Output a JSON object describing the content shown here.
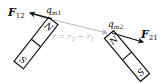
{
  "diagram": {
    "magnets": [
      {
        "id": "magnet-1",
        "north_label": "N",
        "south_label": "S",
        "pole_charge_label": "q",
        "pole_charge_subscript": "m1"
      },
      {
        "id": "magnet-2",
        "north_label": "N",
        "south_label": "S",
        "pole_charge_label": "q",
        "pole_charge_subscript": "m2"
      }
    ],
    "forces": [
      {
        "label": "F",
        "subscript": "12"
      },
      {
        "label": "F",
        "subscript": "21"
      }
    ],
    "separation": {
      "label": "r = r",
      "sub1": "2",
      "minus": " − r",
      "sub2": "1"
    },
    "colors": {
      "ink": "#111111",
      "separation_vector": "#b0b0b0",
      "background": "#ffffff"
    }
  }
}
